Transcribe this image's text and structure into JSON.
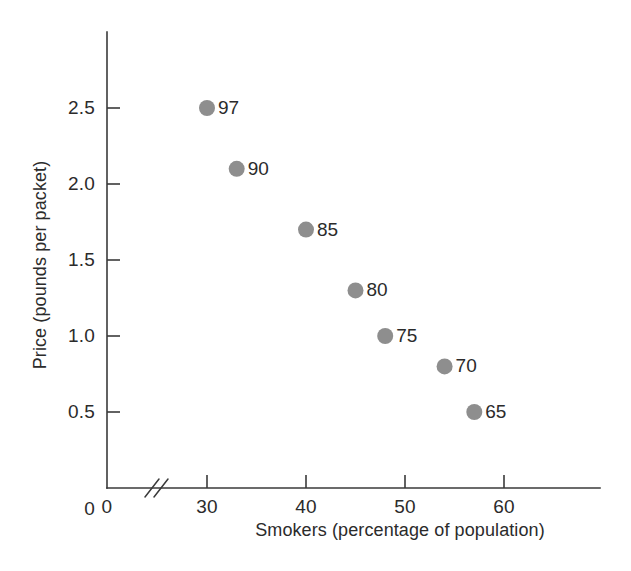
{
  "chart_data": {
    "type": "scatter",
    "title": "",
    "xlabel": "Smokers (percentage of population)",
    "ylabel": "Price (pounds per packet)",
    "xlim": [
      26,
      63
    ],
    "ylim": [
      0,
      2.9
    ],
    "grid": false,
    "legend": "none",
    "x_axis_break": true,
    "x_ticks": [
      {
        "value": 0,
        "label": "0"
      },
      {
        "value": 30,
        "label": "30"
      },
      {
        "value": 40,
        "label": "40"
      },
      {
        "value": 50,
        "label": "50"
      },
      {
        "value": 60,
        "label": "60"
      }
    ],
    "y_ticks": [
      {
        "value": 0,
        "label": "0"
      },
      {
        "value": 0.5,
        "label": "0.5"
      },
      {
        "value": 1.0,
        "label": "1.0"
      },
      {
        "value": 1.5,
        "label": "1.5"
      },
      {
        "value": 2.0,
        "label": "2.0"
      },
      {
        "value": 2.5,
        "label": "2.5"
      }
    ],
    "marker_color": "#8e8e8e",
    "axis_color": "#3a3a3a",
    "points": [
      {
        "label": "97",
        "x": 30,
        "y": 2.5
      },
      {
        "label": "90",
        "x": 33,
        "y": 2.1
      },
      {
        "label": "85",
        "x": 40,
        "y": 1.7
      },
      {
        "label": "80",
        "x": 45,
        "y": 1.3
      },
      {
        "label": "75",
        "x": 48,
        "y": 1.0
      },
      {
        "label": "70",
        "x": 54,
        "y": 0.8
      },
      {
        "label": "65",
        "x": 57,
        "y": 0.5
      }
    ]
  }
}
